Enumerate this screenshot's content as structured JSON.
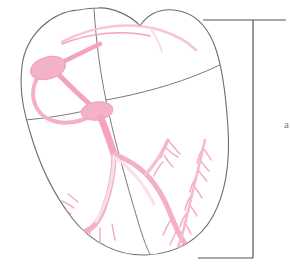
{
  "figure": {
    "view": "anterior coronal section",
    "background_color": "#ffffff"
  },
  "colors": {
    "outline": "#6e6e6e",
    "septum_line": "#7a7a7a",
    "conduction_pink": "#f3a8bf",
    "conduction_pink_light": "#f7c3d3",
    "conduction_pink_pale": "#f9d6e0",
    "node_fill": "#f4b2c6",
    "bracket": "#555555",
    "label_text": "#4a4a4a"
  },
  "anatomy": {
    "outline_name": "heart-outline",
    "chambers": [
      {
        "name": "right-atrium",
        "label": ""
      },
      {
        "name": "left-atrium",
        "label": ""
      },
      {
        "name": "right-ventricle",
        "label": ""
      },
      {
        "name": "left-ventricle",
        "label": ""
      }
    ],
    "dividers": [
      {
        "name": "interatrial-interventricular-septum"
      },
      {
        "name": "atrioventricular-groove-left"
      },
      {
        "name": "atrioventricular-groove-right"
      }
    ]
  },
  "conduction_system": {
    "structures": [
      {
        "name": "sinoatrial-node",
        "shape": "oval",
        "label": ""
      },
      {
        "name": "atrioventricular-node",
        "shape": "oval",
        "label": ""
      },
      {
        "name": "bachmann-bundle",
        "shape": "arc",
        "label": ""
      },
      {
        "name": "internodal-pathway",
        "shape": "loop",
        "label": ""
      },
      {
        "name": "bundle-of-his",
        "shape": "trunk",
        "label": ""
      },
      {
        "name": "left-bundle-branch",
        "shape": "branch",
        "label": ""
      },
      {
        "name": "right-bundle-branch",
        "shape": "branch",
        "label": ""
      },
      {
        "name": "purkinje-fibers",
        "shape": "feathered-branches",
        "label": ""
      }
    ]
  },
  "annotations": {
    "bracket": {
      "name": "measurement-bracket",
      "orientation": "vertical",
      "spans": "full-heart-height",
      "top_y": 20,
      "bottom_y": 258,
      "stem_x": 253
    },
    "bracket_label": {
      "name": "bracket-label",
      "text": "a",
      "visible": "partially-cropped-at-right-edge"
    }
  }
}
